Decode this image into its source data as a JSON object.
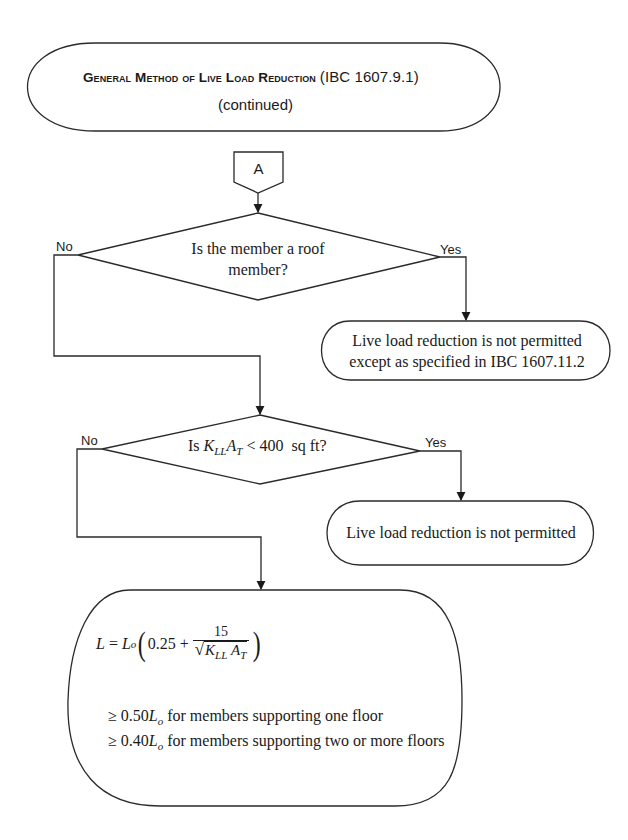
{
  "title": {
    "main_words": [
      "General",
      "Method",
      "of",
      "Live",
      "Load",
      "Reduction"
    ],
    "main": "General Method of Live Load Reduction",
    "reference": "(IBC 1607.9.1)",
    "subtitle": "(continued)"
  },
  "connector": {
    "label": "A"
  },
  "decision_1": {
    "question_line1": "Is the member a roof",
    "question_line2": "member?",
    "no_label": "No",
    "yes_label": "Yes"
  },
  "terminal_1": {
    "line1": "Live load reduction is not permitted",
    "line2": "except as specified in IBC 1607.11.2"
  },
  "decision_2": {
    "prefix": "Is",
    "var_K": "K",
    "sub_LL": "LL",
    "var_A": "A",
    "sub_T": "T",
    "suffix": "< 400  sq ft?",
    "no_label": "No",
    "yes_label": "Yes"
  },
  "terminal_2": {
    "line1": "Live load reduction is not permitted"
  },
  "result": {
    "equation": {
      "lhs": "L",
      "eq": "=",
      "L": "L",
      "sub_o": "o",
      "const": "0.25 +",
      "numerator": "15",
      "sqrt": "√",
      "K": "K",
      "sub_LL": "LL",
      "A": "A",
      "sub_T": "T",
      "open_paren": "(",
      "close_paren": ")"
    },
    "limits": [
      {
        "symbol": "≥ 0.50",
        "var": "L",
        "sub": "o",
        "text": "for members supporting one floor"
      },
      {
        "symbol": "≥ 0.40",
        "var": "L",
        "sub": "o",
        "text": "for members supporting two or more floors"
      }
    ]
  },
  "colors": {
    "stroke": "#2a2a2a",
    "text": "#1a1a1a",
    "background": "#ffffff"
  }
}
